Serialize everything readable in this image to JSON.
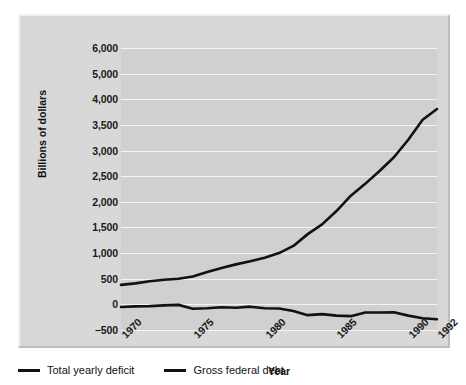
{
  "chart_data": {
    "type": "line",
    "title": "",
    "xlabel": "Year",
    "ylabel": "Billions of dollars",
    "xlim": [
      1970,
      1992
    ],
    "ylim": [
      -500,
      6000
    ],
    "grid": true,
    "legend_position": "bottom-left",
    "x_tick_labels": [
      "1970",
      "1975",
      "1980",
      "1985",
      "1990",
      "1992"
    ],
    "x_tick_values": [
      1970,
      1975,
      1980,
      1985,
      1990,
      1992
    ],
    "y_tick_labels": [
      "6,000",
      "5,000",
      "4,000",
      "3,500",
      "3,000",
      "2,500",
      "2,000",
      "1,500",
      "1,000",
      "500",
      "0",
      "-500"
    ],
    "y_tick_values": [
      6000,
      5000,
      4000,
      3500,
      3000,
      2500,
      2000,
      1500,
      1000,
      500,
      0,
      -500
    ],
    "x": [
      1970,
      1971,
      1972,
      1973,
      1974,
      1975,
      1976,
      1977,
      1978,
      1979,
      1980,
      1981,
      1982,
      1983,
      1984,
      1985,
      1986,
      1987,
      1988,
      1989,
      1990,
      1991,
      1992
    ],
    "series": [
      {
        "name": "Total yearly deficit",
        "color": "#111111",
        "values": [
          -50,
          -40,
          -35,
          -20,
          -10,
          -85,
          -75,
          -55,
          -65,
          -45,
          -75,
          -80,
          -130,
          -210,
          -190,
          -220,
          -230,
          -160,
          -160,
          -155,
          -220,
          -270,
          -290
        ]
      },
      {
        "name": "Gross federal debt",
        "color": "#111111",
        "values": [
          380,
          410,
          450,
          480,
          500,
          545,
          630,
          710,
          780,
          840,
          910,
          1000,
          1140,
          1370,
          1560,
          1820,
          2120,
          2350,
          2600,
          2870,
          3210,
          3600,
          3810
        ]
      }
    ]
  },
  "axes": {
    "y_title": "Billions of dollars",
    "x_title": "Year"
  },
  "legend": {
    "items": [
      {
        "label": "Total yearly deficit",
        "marker": "line-marker-icon"
      },
      {
        "label": "Gross federal debt",
        "marker": "line-marker-icon"
      }
    ]
  },
  "colors": {
    "card_background": "#d8d8d8",
    "plot_background": "#d0d0d0",
    "gridline": "#f4f4f4",
    "line": "#111111",
    "text": "#111111"
  }
}
